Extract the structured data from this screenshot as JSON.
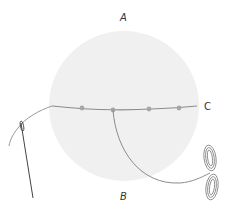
{
  "labels": {
    "a": "A",
    "b": "B",
    "c": "C"
  },
  "colors": {
    "fabric": "#f0f0f0",
    "thread": "#8c8c8c",
    "dot": "#a6a6a6",
    "needle": "#555555",
    "label": "#333333"
  },
  "elements": {
    "fabric_circle": "fabric-circle",
    "thread_line": "running-thread",
    "stitch_dots": 4,
    "needle": "needle-icon",
    "thread_skein": "thread-bow"
  }
}
